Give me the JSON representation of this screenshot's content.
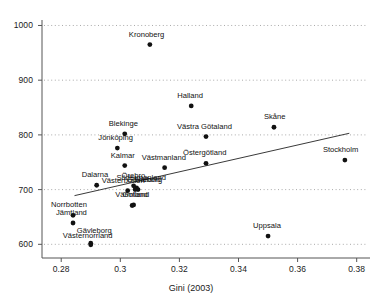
{
  "chart_data": {
    "type": "scatter",
    "title": "",
    "xlabel": "Gini (2003)",
    "ylabel": "",
    "xlim": [
      0.2735,
      0.3845
    ],
    "ylim": [
      575,
      1010
    ],
    "grid": true,
    "grid_style": "dotted horizontal",
    "legend": "none",
    "xticks": [
      0.28,
      0.3,
      0.32,
      0.34,
      0.36,
      0.38
    ],
    "xtick_labels": [
      "0.28",
      "0.3",
      "0.32",
      "0.34",
      "0.36",
      "0.38"
    ],
    "yticks": [
      600,
      700,
      800,
      900,
      1000
    ],
    "ytick_labels": [
      "600",
      "700",
      "800",
      "900",
      "1000"
    ],
    "marker": "filled-circle",
    "marker_color": "#111111",
    "fit_line": {
      "type": "linear",
      "color": "#3a3a3a",
      "x_start": 0.2845,
      "y_start": 689,
      "x_end": 0.3775,
      "y_end": 803
    },
    "points": [
      {
        "label": "Kronoberg",
        "x": 0.31,
        "y": 965,
        "label_dx": -21,
        "label_dy": -10
      },
      {
        "label": "Halland",
        "x": 0.324,
        "y": 853,
        "label_dx": -14,
        "label_dy": -10
      },
      {
        "label": "Skåne",
        "x": 0.352,
        "y": 814,
        "label_dx": -10,
        "label_dy": -10
      },
      {
        "label": "Blekinge",
        "x": 0.3015,
        "y": 802,
        "label_dx": -16,
        "label_dy": -10
      },
      {
        "label": "Västra Götaland",
        "x": 0.329,
        "y": 797,
        "label_dx": -29,
        "label_dy": -10
      },
      {
        "label": "Jönköping",
        "x": 0.299,
        "y": 776,
        "label_dx": -19,
        "label_dy": -10
      },
      {
        "label": "Stockholm",
        "x": 0.376,
        "y": 754,
        "label_dx": -22,
        "label_dy": -10
      },
      {
        "label": "Östergötland",
        "x": 0.329,
        "y": 748,
        "label_dx": -23,
        "label_dy": -10
      },
      {
        "label": "Kalmar",
        "x": 0.3015,
        "y": 744,
        "label_dx": -14,
        "label_dy": -10
      },
      {
        "label": "Västmanland",
        "x": 0.315,
        "y": 740,
        "label_dx": -23,
        "label_dy": -10
      },
      {
        "label": "Dalarna",
        "x": 0.292,
        "y": 708,
        "label_dx": -15,
        "label_dy": -10
      },
      {
        "label": "Södermanland",
        "x": 0.3055,
        "y": 703,
        "label_dx": -20,
        "label_dy": -10
      },
      {
        "label": "Örebro",
        "x": 0.3045,
        "y": 707,
        "label_dx": -12,
        "label_dy": -10
      },
      {
        "label": "Halland ",
        "x": 0.306,
        "y": 700,
        "label_dx": -3,
        "label_dy": -10
      },
      {
        "label": "Västerbotten",
        "x": 0.3025,
        "y": 698,
        "label_dx": -26,
        "label_dy": -10
      },
      {
        "label": "Gävleborg ",
        "x": 0.305,
        "y": 700,
        "label_dx": -8,
        "label_dy": -10
      },
      {
        "label": "Värmland",
        "x": 0.304,
        "y": 671,
        "label_dx": -17,
        "label_dy": -10
      },
      {
        "label": "Gotland",
        "x": 0.3045,
        "y": 672,
        "label_dx": -11,
        "label_dy": -10
      },
      {
        "label": "Norrbotten",
        "x": 0.284,
        "y": 653,
        "label_dx": -22,
        "label_dy": -10
      },
      {
        "label": "Jämtland",
        "x": 0.284,
        "y": 639,
        "label_dx": -17,
        "label_dy": -10
      },
      {
        "label": "Uppsala",
        "x": 0.35,
        "y": 615,
        "label_dx": -15,
        "label_dy": -10
      },
      {
        "label": "Gävleborg",
        "x": 0.29,
        "y": 602,
        "label_dx": -14,
        "label_dy": -12
      },
      {
        "label": "Västernorrland",
        "x": 0.29,
        "y": 599,
        "label_dx": -28,
        "label_dy": -9
      }
    ]
  }
}
